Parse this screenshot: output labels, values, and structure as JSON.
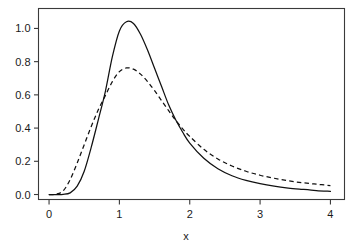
{
  "chart_data": {
    "type": "line",
    "title": "",
    "subtitle": "",
    "xlabel": "x",
    "ylabel": "",
    "xlim": [
      -0.15,
      4.2
    ],
    "ylim": [
      -0.03,
      1.12
    ],
    "grid": false,
    "legend": "none",
    "xticks": [
      0,
      1,
      2,
      3,
      4
    ],
    "xtick_labels": [
      "0",
      "1",
      "2",
      "3",
      "4"
    ],
    "yticks": [
      0.0,
      0.2,
      0.4,
      0.6,
      0.8,
      1.0
    ],
    "ytick_labels": [
      "0.0",
      "0.2",
      "0.4",
      "0.6",
      "0.8",
      "1.0"
    ],
    "x": [
      0.0,
      0.1,
      0.2,
      0.3,
      0.4,
      0.5,
      0.6,
      0.7,
      0.8,
      0.9,
      1.0,
      1.1,
      1.2,
      1.3,
      1.4,
      1.5,
      1.6,
      1.7,
      1.8,
      1.9,
      2.0,
      2.2,
      2.4,
      2.6,
      2.8,
      3.0,
      3.2,
      3.4,
      3.6,
      3.8,
      4.0
    ],
    "series": [
      {
        "name": "solid-curve",
        "style": "solid",
        "color": "#111111",
        "peak_x": 1.08,
        "peak_y": 1.04,
        "values": [
          0.0,
          0.0,
          0.001,
          0.01,
          0.05,
          0.14,
          0.285,
          0.45,
          0.62,
          0.83,
          0.985,
          1.04,
          1.03,
          0.965,
          0.87,
          0.76,
          0.65,
          0.54,
          0.45,
          0.375,
          0.31,
          0.218,
          0.155,
          0.113,
          0.085,
          0.065,
          0.05,
          0.039,
          0.031,
          0.024,
          0.019
        ]
      },
      {
        "name": "dashed-curve",
        "style": "dashed",
        "color": "#111111",
        "peak_x": 1.1,
        "peak_y": 0.762,
        "values": [
          0.0,
          0.002,
          0.022,
          0.09,
          0.19,
          0.3,
          0.41,
          0.51,
          0.595,
          0.68,
          0.74,
          0.762,
          0.755,
          0.725,
          0.68,
          0.625,
          0.565,
          0.505,
          0.447,
          0.395,
          0.35,
          0.272,
          0.214,
          0.172,
          0.14,
          0.116,
          0.098,
          0.083,
          0.071,
          0.062,
          0.054
        ]
      }
    ],
    "annotations": []
  },
  "axes": {
    "x_axis_title": "x",
    "frame": "box"
  }
}
